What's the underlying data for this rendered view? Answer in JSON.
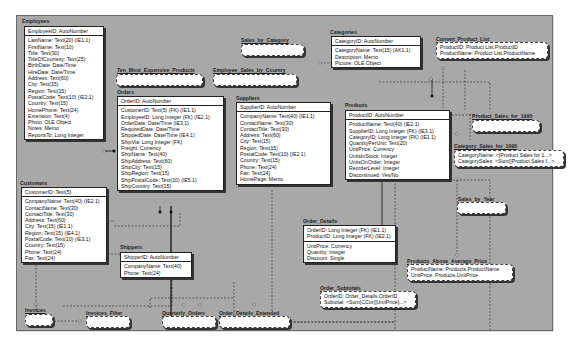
{
  "diagram": {
    "tables": {
      "employees": {
        "title": "Employees",
        "pk": "EmployeeID: AutoNumber",
        "fields": [
          "LastName: Text(20) (IE1.1)",
          "FirstName: Text(10)",
          "Title: Text(30)",
          "TitleOfCourtesy: Text(25)",
          "BirthDate: Date/Time",
          "HireDate: Date/Time",
          "Address: Text(60)",
          "City: Text(15)",
          "Region: Text(15)",
          "PostalCode: Text(10) (IE2.1)",
          "Country: Text(15)",
          "HomePhone: Text(24)",
          "Extension: Text(4)",
          "Photo: OLE Object",
          "Notes: Memo",
          "ReportsTo: Long Integer"
        ]
      },
      "customers": {
        "title": "Customers",
        "pk": "CustomerID: Text(5)",
        "fields": [
          "CompanyName: Text(40) (IE2.1)",
          "ContactName: Text(30)",
          "ContactTitle: Text(30)",
          "Address: Text(60)",
          "City: Text(15) (IE1.1)",
          "Region: Text(15) (IE4.1)",
          "PostalCode: Text(10) (IE3.1)",
          "Country: Text(15)",
          "Phone: Text(24)",
          "Fax: Text(24)"
        ]
      },
      "orders": {
        "title": "Orders",
        "pk": "OrderID: AutoNumber",
        "fields": [
          "CustomerID: Text(5) (FK) (IE1.1)",
          "EmployeeID: Long Integer (FK) (IE2.1)",
          "OrderDate: Date/Time (IE3.1)",
          "RequiredDate: Date/Time",
          "ShippedDate: Date/Time (IE4.1)",
          "ShipVia: Long Integer (FK)",
          "Freight: Currency",
          "ShipName: Text(40)",
          "ShipAddress: Text(60)",
          "ShipCity: Text(15)",
          "ShipRegion: Text(15)",
          "ShipPostalCode: Text(10) (IE5.1)",
          "ShipCountry: Text(15)"
        ]
      },
      "shippers": {
        "title": "Shippers",
        "pk": "ShipperID: AutoNumber",
        "fields": [
          "CompanyName: Text(40)",
          "Phone: Text(24)"
        ]
      },
      "suppliers": {
        "title": "Suppliers",
        "pk": "SupplierID: AutoNumber",
        "fields": [
          "CompanyName: Text(40) (IE1.1)",
          "ContactName: Text(30)",
          "ContactTitle: Text(30)",
          "Address: Text(60)",
          "City: Text(15)",
          "Region: Text(15)",
          "PostalCode: Text(10) (IE2.1)",
          "Country: Text(15)",
          "Phone: Text(24)",
          "Fax: Text(24)",
          "HomePage: Memo"
        ]
      },
      "categories": {
        "title": "Categories",
        "pk": "CategoryID: AutoNumber",
        "fields": [
          "CategoryName: Text(15) (AK1.1)",
          "Description: Memo",
          "Picture: OLE Object"
        ]
      },
      "products": {
        "title": "Products",
        "pk": "ProductID: AutoNumber",
        "fields": [
          "ProductName: Text(40) (IE2.1)",
          "SupplierID: Long Integer (FK) (IE3.1)",
          "CategoryID: Long Integer (FK) (IE1.1)",
          "QuantityPerUnit: Text(20)",
          "UnitPrice: Currency",
          "UnitsInStock: Integer",
          "UnitsOnOrder: Integer",
          "ReorderLevel: Integer",
          "Discontinued: Yes/No"
        ]
      },
      "order_details": {
        "title": "Order_Details",
        "pk_lines": [
          "OrderID: Long Integer (FK) (IE1.1)",
          "ProductID: Long Integer (FK) (IE2.1)"
        ],
        "fields": [
          "UnitPrice: Currency",
          "Quantity: Integer",
          "Discount: Single"
        ]
      }
    },
    "views": {
      "sales_by_category": {
        "title": "Sales_by_Category",
        "fields": []
      },
      "ten_most_expensive": {
        "title": "Ten_Most_Expensive_Products",
        "fields": []
      },
      "employee_sales": {
        "title": "Employee_Sales_by_Country",
        "fields": []
      },
      "current_product_list": {
        "title": "Current_Product_List",
        "fields": [
          "ProductID: Product List.ProductID",
          "ProductName: Product List.ProductName"
        ]
      },
      "product_sales_1995": {
        "title": "Product_Sales_for_1995",
        "fields": []
      },
      "category_sales_1995": {
        "title": "Category_Sales_for_1995",
        "fields": [
          "CategoryName: <[Product Sales for 1...>",
          "CategorySales: <Sum([Product Sales f...>"
        ]
      },
      "sales_by_year": {
        "title": "Sales_by_Year",
        "fields": []
      },
      "products_above_avg": {
        "title": "Products_Above_Average_Price",
        "fields": [
          "ProductName: Products.ProductName",
          "UnitPrice: Products.UnitPrice"
        ]
      },
      "order_subtotals": {
        "title": "Order_Subtotals",
        "fields": [
          "OrderID: Order_Details.OrderID",
          "Subtotal: <Sum(CCur([UnitPrice]...>"
        ]
      },
      "invoices": {
        "title": "Invoices",
        "fields": []
      },
      "invoices_filter": {
        "title": "Invoices_Filter",
        "fields": []
      },
      "quarterly_orders": {
        "title": "Quarterly_Orders",
        "fields": []
      },
      "order_details_extended": {
        "title": "Order_Details_Extended",
        "fields": []
      }
    }
  }
}
